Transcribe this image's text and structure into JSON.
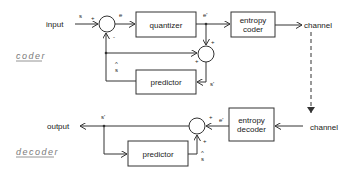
{
  "diagram": {
    "sections": {
      "coder": "coder",
      "decoder": "decoder"
    },
    "coder": {
      "input_label": "input",
      "signal_s": "s",
      "signal_e": "e",
      "signal_e_prime": "e'",
      "signal_s_hat": "s",
      "signal_s_prime": "s'",
      "sum1_plus": "+",
      "sum1_minus": "-",
      "sum2_plus_top": "+",
      "sum2_plus_left": "+",
      "quantizer": "quantizer",
      "entropy_coder_line1": "entropy",
      "entropy_coder_line2": "coder",
      "predictor": "predictor",
      "channel": "channel"
    },
    "decoder": {
      "output_label": "output",
      "signal_s_prime": "s'",
      "signal_e_prime": "e'",
      "signal_s_hat": "s",
      "sum_plus_right": "+",
      "sum_plus_bottom": "+",
      "entropy_decoder_line1": "entropy",
      "entropy_decoder_line2": "decoder",
      "predictor": "predictor",
      "channel": "channel"
    },
    "hat_glyph": "^"
  }
}
